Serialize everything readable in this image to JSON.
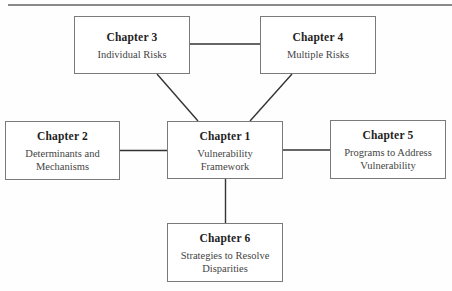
{
  "diagram": {
    "type": "hub-and-spoke chapter map",
    "nodes": [
      {
        "id": "ch1",
        "title": "Chapter 1",
        "lines": [
          "Vulnerability",
          "Framework"
        ]
      },
      {
        "id": "ch2",
        "title": "Chapter 2",
        "lines": [
          "Determinants and",
          "Mechanisms"
        ]
      },
      {
        "id": "ch3",
        "title": "Chapter 3",
        "lines": [
          "Individual Risks"
        ]
      },
      {
        "id": "ch4",
        "title": "Chapter 4",
        "lines": [
          "Multiple Risks"
        ]
      },
      {
        "id": "ch5",
        "title": "Chapter 5",
        "lines": [
          "Programs to Address",
          "Vulnerability"
        ]
      },
      {
        "id": "ch6",
        "title": "Chapter 6",
        "lines": [
          "Strategies to Resolve",
          "Disparities"
        ]
      }
    ],
    "edges": [
      {
        "from": "ch3",
        "to": "ch4"
      },
      {
        "from": "ch3",
        "to": "ch1"
      },
      {
        "from": "ch4",
        "to": "ch1"
      },
      {
        "from": "ch2",
        "to": "ch1"
      },
      {
        "from": "ch1",
        "to": "ch5"
      },
      {
        "from": "ch1",
        "to": "ch6"
      }
    ]
  },
  "colors": {
    "line": "#333333",
    "box_border": "#7a7a7a",
    "title_text": "#1e1e1e",
    "body_text": "#444444",
    "top_rule": "#8a8a8a"
  }
}
